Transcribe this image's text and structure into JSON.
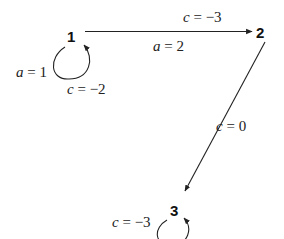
{
  "diagram": {
    "nodes": [
      {
        "id": "1",
        "label": "1"
      },
      {
        "id": "2",
        "label": "2"
      },
      {
        "id": "3",
        "label": "3"
      }
    ],
    "edges": [
      {
        "from": "1",
        "to": "2",
        "labels": {
          "above": {
            "var": "c",
            "eq": " = −3"
          },
          "below": {
            "var": "a",
            "eq": " = 2"
          }
        }
      },
      {
        "from": "1",
        "to": "1",
        "labels": {
          "left": {
            "var": "a",
            "eq": " = 1"
          },
          "below": {
            "var": "c",
            "eq": " = −2"
          }
        }
      },
      {
        "from": "2",
        "to": "3",
        "labels": {
          "right": {
            "var": "c",
            "eq": " = 0"
          }
        }
      },
      {
        "from": "3",
        "to": "3",
        "labels": {
          "left": {
            "var": "c",
            "eq": " = −3"
          }
        }
      }
    ],
    "colors": {
      "stroke": "#222222",
      "text": "#222222"
    }
  }
}
